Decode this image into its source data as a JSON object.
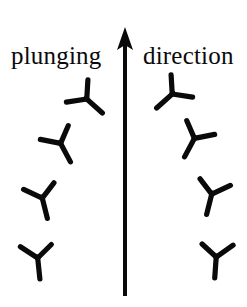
{
  "figure": {
    "width": 247,
    "height": 307,
    "background": "#ffffff",
    "ink_color": "#0a0a0a",
    "caption_left": "plunging",
    "caption_right": "direction"
  },
  "arrow": {
    "name": "upward-arrow",
    "shaft_x": 125,
    "shaft_top_y": 44,
    "shaft_bottom_y": 296,
    "shaft_width": 4,
    "head_tip_y": 27,
    "head_base_y": 50,
    "head_half_width": 8
  },
  "symbols": {
    "description": "plunging lineation tick marks fanning outward from the central arrow",
    "left": [
      {
        "name": "lineation-symbol-left-1",
        "cx": 89,
        "cy": 101,
        "rotation": -48,
        "scale": 1.0
      },
      {
        "name": "lineation-symbol-left-2",
        "cx": 62,
        "cy": 146,
        "rotation": -28,
        "scale": 1.0
      },
      {
        "name": "lineation-symbol-left-3",
        "cx": 43,
        "cy": 201,
        "rotation": -14,
        "scale": 1.0
      },
      {
        "name": "lineation-symbol-left-4",
        "cx": 38,
        "cy": 261,
        "rotation": -6,
        "scale": 1.0
      }
    ],
    "right": [
      {
        "name": "lineation-symbol-right-1",
        "cx": 170,
        "cy": 96,
        "rotation": 48,
        "scale": 1.0
      },
      {
        "name": "lineation-symbol-right-2",
        "cx": 193,
        "cy": 141,
        "rotation": 28,
        "scale": 1.0
      },
      {
        "name": "lineation-symbol-right-3",
        "cx": 211,
        "cy": 197,
        "rotation": 14,
        "scale": 1.0
      },
      {
        "name": "lineation-symbol-right-4",
        "cx": 216,
        "cy": 260,
        "rotation": 4,
        "scale": 1.0
      }
    ]
  }
}
